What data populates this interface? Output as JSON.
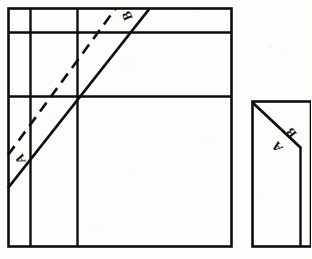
{
  "document": {
    "kind": "technical-line-drawing",
    "background_color": "#fdfdfc",
    "ink_color": "#0d0d0d",
    "width": 311,
    "height": 259
  },
  "figures": [
    {
      "id": "left-figure",
      "name": "left-elevation-view",
      "frame": {
        "x": 8,
        "y": 8,
        "width": 224,
        "height": 239
      },
      "vertical_rules": [
        30,
        77
      ],
      "horizontal_rules": [
        32,
        97
      ],
      "solid_diagonal": {
        "x1": 8,
        "y1": 188,
        "x2": 150,
        "y2": 8
      },
      "dashed_diagonal": {
        "x1": 8,
        "y1": 155,
        "x2": 116,
        "y2": 8
      },
      "labels": [
        {
          "text": "A",
          "x": 20,
          "y": 159,
          "rotation": -112,
          "size": 13
        },
        {
          "text": "B",
          "x": 127,
          "y": 16,
          "rotation": -112,
          "size": 13
        }
      ]
    },
    {
      "id": "right-figure",
      "name": "right-section-view",
      "frame": {
        "x": 252,
        "y": 101,
        "width": 59,
        "height": 146
      },
      "vertical_rules": [
        300
      ],
      "solid_diagonal": {
        "x1": 253,
        "y1": 103,
        "x2": 301,
        "y2": 148
      },
      "labels": [
        {
          "text": "A",
          "x": 277,
          "y": 147,
          "rotation": -128,
          "size": 13
        },
        {
          "text": "B",
          "x": 291,
          "y": 133,
          "rotation": -128,
          "size": 13
        }
      ]
    }
  ],
  "annotations": {
    "label_a": "A",
    "label_b": "B"
  }
}
